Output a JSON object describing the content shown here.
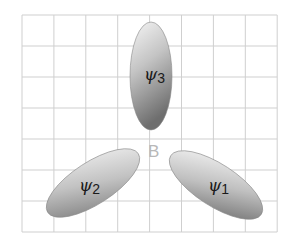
{
  "diagram": {
    "grid": {
      "x0": 22,
      "y0": 15,
      "cols": 8,
      "rows": 7,
      "cell_w": 31.9,
      "cell_h": 31,
      "line_color": "#cfcfcf"
    },
    "center_label": "B",
    "lobes": [
      {
        "id": "psi3",
        "symbol": "ψ",
        "subscript": "3",
        "cx": 151,
        "cy": 76,
        "rx": 21,
        "ry": 54,
        "angle": 0
      },
      {
        "id": "psi2",
        "symbol": "ψ",
        "subscript": "2",
        "cx": 93,
        "cy": 183,
        "rx": 54,
        "ry": 21,
        "angle": -33
      },
      {
        "id": "psi1",
        "symbol": "ψ",
        "subscript": "1",
        "cx": 216,
        "cy": 185,
        "rx": 54,
        "ry": 21,
        "angle": 33
      }
    ],
    "colors": {
      "lobe_light": "#f4f4f4",
      "lobe_dark": "#7a7a7a",
      "center_label": "#b8b8b8"
    }
  }
}
